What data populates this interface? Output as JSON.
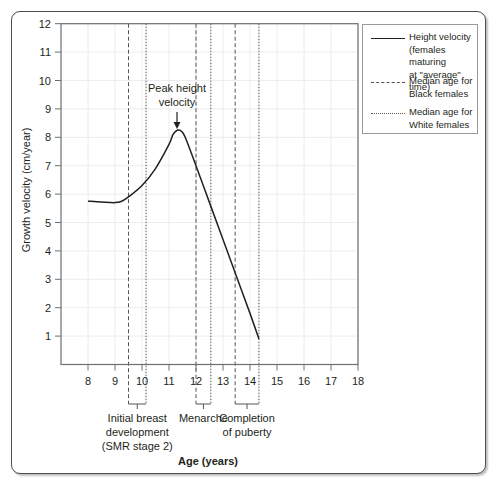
{
  "chart_data": {
    "type": "line",
    "title": "",
    "xlabel": "Age (years)",
    "ylabel": "Growth velocity (cm/year)",
    "xlim": [
      7,
      18
    ],
    "ylim": [
      0,
      12
    ],
    "x_ticks": [
      8,
      9,
      10,
      11,
      12,
      13,
      14,
      15,
      16,
      17,
      18
    ],
    "y_ticks": [
      1,
      2,
      3,
      4,
      5,
      6,
      7,
      8,
      9,
      10,
      11,
      12
    ],
    "grid": true,
    "legend_position": "right-outside-top",
    "series": [
      {
        "name": "Height velocity (females maturing at \"average\" time)",
        "style": "solid",
        "x": [
          8,
          8.5,
          9,
          9.25,
          9.5,
          10,
          10.5,
          11,
          11.15,
          11.3,
          11.45,
          11.6,
          12,
          12.5,
          13,
          13.5,
          14,
          14.33
        ],
        "y": [
          5.75,
          5.72,
          5.7,
          5.75,
          5.9,
          6.3,
          6.9,
          7.75,
          8.1,
          8.25,
          8.22,
          8.0,
          7.0,
          5.7,
          4.4,
          3.1,
          1.8,
          0.9
        ]
      }
    ],
    "reference_lines": [
      {
        "name": "Median age for Black females",
        "style": "dashed",
        "x": 9.5,
        "event": "Initial breast development"
      },
      {
        "name": "Median age for White females",
        "style": "dotted",
        "x": 10.15,
        "event": "Initial breast development"
      },
      {
        "name": "Median age for Black females",
        "style": "dashed",
        "x": 12.0,
        "event": "Menarche"
      },
      {
        "name": "Median age for White females",
        "style": "dotted",
        "x": 12.55,
        "event": "Menarche"
      },
      {
        "name": "Median age for Black females",
        "style": "dashed",
        "x": 13.45,
        "event": "Completion of puberty"
      },
      {
        "name": "Median age for White females",
        "style": "dotted",
        "x": 14.33,
        "event": "Completion of puberty"
      }
    ],
    "annotations": [
      {
        "text": "Peak height velocity",
        "x": 11.3,
        "y": 8.25,
        "arrow": true
      }
    ],
    "legend": [
      {
        "label": "Height velocity (females maturing at \"average\" time)",
        "style": "solid"
      },
      {
        "label": "Median age for Black females",
        "style": "dashed"
      },
      {
        "label": "Median age for White females",
        "style": "dotted"
      }
    ]
  },
  "labels": {
    "ylabel": "Growth velocity (cm/year)",
    "xlabel": "Age (years)",
    "peak_line1": "Peak height",
    "peak_line2": "velocity",
    "events": [
      {
        "lines": [
          "Initial breast",
          "development",
          "(SMR stage 2)"
        ]
      },
      {
        "lines": [
          "Menarche"
        ]
      },
      {
        "lines": [
          "Completion",
          "of puberty"
        ]
      }
    ],
    "legend": [
      {
        "lines": [
          "Height velocity",
          "(females maturing",
          "at \"average\" time)"
        ]
      },
      {
        "lines": [
          "Median age for",
          "Black females"
        ]
      },
      {
        "lines": [
          "Median age for",
          "White females"
        ]
      }
    ]
  },
  "colors": {
    "line": "#231f20",
    "grid": "#ececec",
    "axis": "#6d6e71",
    "frame": "#4d4d4d"
  }
}
